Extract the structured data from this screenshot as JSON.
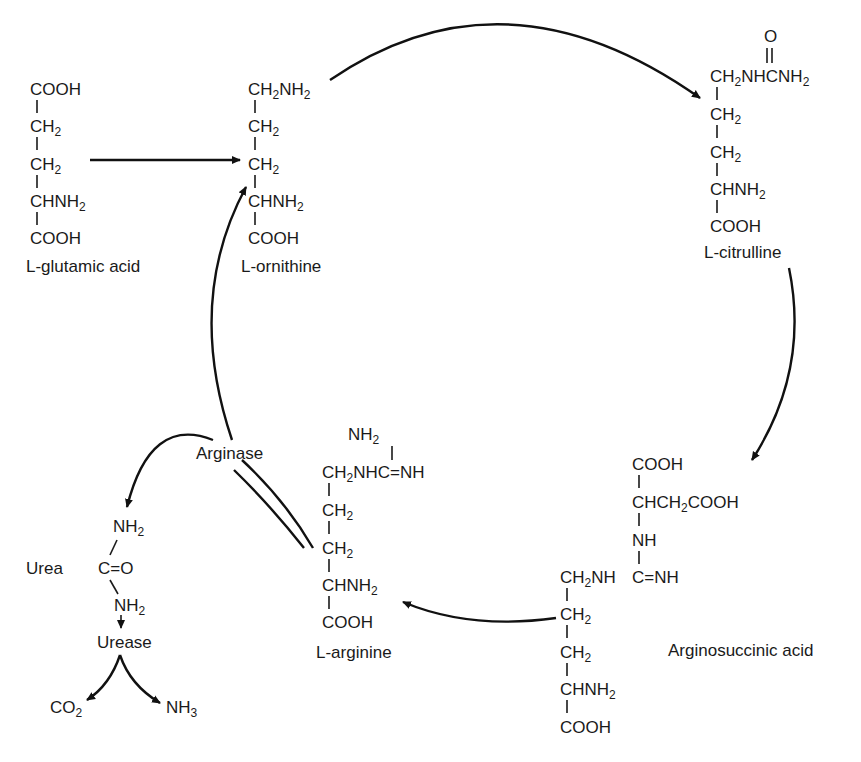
{
  "diagram": {
    "type": "metabolic-cycle",
    "colors": {
      "ink": "#1a1a1a",
      "background": "#ffffff"
    },
    "compounds": {
      "glutamic_acid": {
        "name": "L-glutamic acid",
        "lines": [
          "COOH",
          "CH2",
          "CH2",
          "CHNH2",
          "COOH"
        ]
      },
      "ornithine": {
        "name": "L-ornithine",
        "lines": [
          "CH2NH2",
          "CH2",
          "CH2",
          "CHNH2",
          "COOH"
        ]
      },
      "citrulline": {
        "name": "L-citrulline",
        "top": "O",
        "lines": [
          "CH2NHCNH2",
          "CH2",
          "CH2",
          "CHNH2",
          "COOH"
        ]
      },
      "arginosuccinic_acid": {
        "name": "Arginosuccinic acid",
        "succinyl_lines": [
          "COOH",
          "CHCH2COOH",
          "NH"
        ],
        "guanidino": "C=NH",
        "lines": [
          "CH2NH",
          "CH2",
          "CH2",
          "CHNH2",
          "COOH"
        ]
      },
      "arginine": {
        "name": "L-arginine",
        "top": "NH2",
        "lines": [
          "CH2NHC=NH",
          "CH2",
          "CH2",
          "CHNH2",
          "COOH"
        ]
      },
      "urea": {
        "name": "Urea",
        "lines": [
          "NH2",
          "C=O",
          "NH2"
        ]
      }
    },
    "enzymes": {
      "arginase": "Arginase",
      "urease": "Urease"
    },
    "products": {
      "co2": "CO2",
      "nh3": "NH3"
    }
  }
}
